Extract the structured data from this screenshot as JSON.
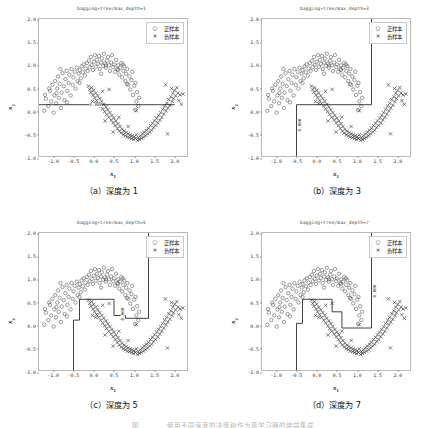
{
  "figure": {
    "caption_partial": "图　　　　使用不同深度的决策树作为基学习器的装袋集成",
    "legend": {
      "positive_label": "正样本",
      "negative_label": "负样本",
      "positive_marker": "circle-marker",
      "negative_marker": "cross-marker"
    },
    "axis": {
      "xlabel": "x1",
      "ylabel": "x2",
      "xticks": [
        "-1.0",
        "-0.5",
        "0.0",
        "0.5",
        "1.0",
        "1.5",
        "2.0"
      ],
      "yticks": [
        "2.0",
        "1.5",
        "1.0",
        "0.5",
        "0.0",
        "-0.5",
        "-1.0"
      ],
      "xlim": [
        -1.35,
        2.35
      ],
      "ylim": [
        -1.0,
        2.0
      ]
    },
    "colors": {
      "positive": "#4d4d4d",
      "negative": "#2b2b2b",
      "boundary": "#111111",
      "frame": "#b9b9b9"
    },
    "panels": [
      {
        "id": "panel-a",
        "title": "bagging+tree/max_depth=1",
        "caption": "（a）深度为 1",
        "max_depth": 1,
        "contour_label": "0.000"
      },
      {
        "id": "panel-b",
        "title": "bagging+tree/max_depth=3",
        "caption": "（b）深度为 3",
        "max_depth": 3,
        "contour_label": "0.000"
      },
      {
        "id": "panel-c",
        "title": "bagging+tree/max_depth=5",
        "caption": "（c）深度为 5",
        "max_depth": 5,
        "contour_label": "0.000"
      },
      {
        "id": "panel-d",
        "title": "bagging+tree/max_depth=7",
        "caption": "（d）深度为 7",
        "max_depth": 7,
        "contour_label": "0.000"
      }
    ]
  },
  "chart_data": {
    "type": "scatter",
    "xlabel": "x1",
    "ylabel": "x2",
    "xlim": [
      -1.35,
      2.35
    ],
    "ylim": [
      -1.0,
      2.0
    ],
    "grid": false,
    "legend_position": "upper right",
    "series": [
      {
        "name": "正样本",
        "marker": "o",
        "color": "#4d4d4d",
        "points": [
          [
            -1.22,
            0.02
          ],
          [
            -1.18,
            0.28
          ],
          [
            -1.12,
            0.12
          ],
          [
            -1.08,
            0.45
          ],
          [
            -1.05,
            0.22
          ],
          [
            -1.02,
            0.58
          ],
          [
            -0.99,
            -0.02
          ],
          [
            -0.97,
            0.35
          ],
          [
            -0.95,
            0.66
          ],
          [
            -0.93,
            0.18
          ],
          [
            -0.9,
            0.5
          ],
          [
            -0.88,
            0.76
          ],
          [
            -0.86,
            0.3
          ],
          [
            -0.84,
            0.6
          ],
          [
            -0.81,
            0.08
          ],
          [
            -0.79,
            0.41
          ],
          [
            -0.77,
            0.83
          ],
          [
            -0.74,
            0.55
          ],
          [
            -0.72,
            0.25
          ],
          [
            -0.7,
            0.7
          ],
          [
            -0.67,
            0.88
          ],
          [
            -0.65,
            0.45
          ],
          [
            -0.62,
            0.62
          ],
          [
            -0.6,
            0.8
          ],
          [
            -0.57,
            0.35
          ],
          [
            -0.55,
            0.92
          ],
          [
            -0.52,
            0.58
          ],
          [
            -0.5,
            0.74
          ],
          [
            -0.47,
            0.86
          ],
          [
            -0.45,
            0.5
          ],
          [
            -0.42,
            0.95
          ],
          [
            -0.4,
            0.66
          ],
          [
            -0.37,
            0.82
          ],
          [
            -0.35,
            0.9
          ],
          [
            -0.32,
            0.72
          ],
          [
            -0.3,
            0.98
          ],
          [
            -0.27,
            0.85
          ],
          [
            -0.25,
            1.02
          ],
          [
            -0.22,
            0.78
          ],
          [
            -0.2,
            0.93
          ],
          [
            -0.17,
            1.05
          ],
          [
            -0.15,
            0.88
          ],
          [
            -0.12,
            1.1
          ],
          [
            -0.1,
            0.96
          ],
          [
            -0.07,
            1.18
          ],
          [
            -0.05,
            1.01
          ],
          [
            -0.02,
            0.9
          ],
          [
            0.0,
            1.08
          ],
          [
            0.03,
            1.22
          ],
          [
            0.05,
            0.97
          ],
          [
            0.08,
            1.12
          ],
          [
            0.1,
            1.03
          ],
          [
            0.13,
            1.2
          ],
          [
            0.15,
            0.92
          ],
          [
            0.18,
            1.06
          ],
          [
            0.2,
            1.15
          ],
          [
            0.23,
            0.99
          ],
          [
            0.25,
            1.25
          ],
          [
            0.28,
            1.04
          ],
          [
            0.3,
            0.95
          ],
          [
            0.33,
            1.1
          ],
          [
            0.35,
            1.18
          ],
          [
            0.38,
            1.0
          ],
          [
            0.4,
            0.88
          ],
          [
            0.43,
            1.06
          ],
          [
            0.45,
            1.22
          ],
          [
            0.48,
            0.96
          ],
          [
            0.5,
            1.02
          ],
          [
            0.53,
            0.86
          ],
          [
            0.55,
            1.12
          ],
          [
            0.58,
            0.92
          ],
          [
            0.6,
            1.0
          ],
          [
            0.63,
            0.8
          ],
          [
            0.65,
            0.95
          ],
          [
            0.68,
            1.05
          ],
          [
            0.7,
            0.74
          ],
          [
            0.73,
            0.88
          ],
          [
            0.75,
            0.98
          ],
          [
            0.78,
            0.66
          ],
          [
            0.8,
            0.82
          ],
          [
            0.83,
            0.92
          ],
          [
            0.85,
            0.58
          ],
          [
            0.88,
            0.76
          ],
          [
            0.9,
            0.48
          ],
          [
            0.93,
            0.68
          ],
          [
            0.95,
            0.86
          ],
          [
            0.97,
            0.36
          ],
          [
            1.0,
            0.56
          ],
          [
            1.02,
            0.04
          ],
          [
            1.05,
            0.22
          ],
          [
            1.07,
            0.42
          ],
          [
            1.1,
            0.12
          ],
          [
            1.12,
            0.3
          ],
          [
            0.82,
            0.6
          ],
          [
            0.6,
            0.9
          ],
          [
            -0.92,
            0.4
          ],
          [
            -1.1,
            0.5
          ],
          [
            -0.66,
            0.2
          ],
          [
            -0.35,
            0.62
          ],
          [
            0.18,
            0.82
          ],
          [
            -1.2,
            0.36
          ],
          [
            -0.82,
            0.92
          ],
          [
            0.3,
            1.0
          ],
          [
            0.72,
            1.02
          ],
          [
            1.03,
            0.62
          ]
        ]
      },
      {
        "name": "负样本",
        "marker": "x",
        "color": "#2b2b2b",
        "points": [
          [
            -0.13,
            0.55
          ],
          [
            -0.1,
            0.48
          ],
          [
            -0.07,
            0.42
          ],
          [
            -0.05,
            0.52
          ],
          [
            -0.02,
            0.36
          ],
          [
            0.0,
            0.46
          ],
          [
            0.02,
            0.3
          ],
          [
            0.05,
            0.4
          ],
          [
            0.07,
            0.24
          ],
          [
            0.1,
            0.34
          ],
          [
            0.12,
            0.18
          ],
          [
            0.15,
            0.28
          ],
          [
            0.17,
            0.12
          ],
          [
            0.2,
            0.22
          ],
          [
            0.22,
            0.06
          ],
          [
            0.25,
            0.16
          ],
          [
            0.27,
            0.0
          ],
          [
            0.3,
            0.1
          ],
          [
            0.32,
            -0.06
          ],
          [
            0.35,
            0.04
          ],
          [
            0.37,
            -0.12
          ],
          [
            0.4,
            -0.02
          ],
          [
            0.43,
            -0.18
          ],
          [
            0.45,
            -0.08
          ],
          [
            0.48,
            -0.24
          ],
          [
            0.5,
            -0.14
          ],
          [
            0.53,
            -0.3
          ],
          [
            0.55,
            -0.2
          ],
          [
            0.58,
            -0.36
          ],
          [
            0.6,
            -0.26
          ],
          [
            0.63,
            -0.42
          ],
          [
            0.65,
            -0.32
          ],
          [
            0.68,
            -0.46
          ],
          [
            0.7,
            -0.38
          ],
          [
            0.73,
            -0.5
          ],
          [
            0.75,
            -0.42
          ],
          [
            0.78,
            -0.52
          ],
          [
            0.8,
            -0.45
          ],
          [
            0.83,
            -0.55
          ],
          [
            0.85,
            -0.48
          ],
          [
            0.88,
            -0.56
          ],
          [
            0.9,
            -0.5
          ],
          [
            0.93,
            -0.58
          ],
          [
            0.95,
            -0.52
          ],
          [
            0.98,
            -0.6
          ],
          [
            1.0,
            -0.54
          ],
          [
            1.03,
            -0.58
          ],
          [
            1.05,
            -0.5
          ],
          [
            1.08,
            -0.62
          ],
          [
            1.1,
            -0.56
          ],
          [
            1.13,
            -0.6
          ],
          [
            1.15,
            -0.52
          ],
          [
            1.18,
            -0.58
          ],
          [
            1.2,
            -0.48
          ],
          [
            1.23,
            -0.55
          ],
          [
            1.25,
            -0.44
          ],
          [
            1.28,
            -0.52
          ],
          [
            1.3,
            -0.4
          ],
          [
            1.33,
            -0.48
          ],
          [
            1.35,
            -0.36
          ],
          [
            1.38,
            -0.44
          ],
          [
            1.4,
            -0.3
          ],
          [
            1.43,
            -0.4
          ],
          [
            1.45,
            -0.25
          ],
          [
            1.48,
            -0.34
          ],
          [
            1.5,
            -0.2
          ],
          [
            1.53,
            -0.3
          ],
          [
            1.55,
            -0.14
          ],
          [
            1.58,
            -0.24
          ],
          [
            1.6,
            -0.08
          ],
          [
            1.63,
            -0.18
          ],
          [
            1.65,
            -0.02
          ],
          [
            1.68,
            -0.12
          ],
          [
            1.7,
            0.05
          ],
          [
            1.73,
            -0.05
          ],
          [
            1.75,
            0.12
          ],
          [
            1.78,
            0.02
          ],
          [
            1.8,
            0.18
          ],
          [
            1.83,
            0.08
          ],
          [
            1.85,
            0.26
          ],
          [
            1.88,
            0.14
          ],
          [
            1.9,
            0.32
          ],
          [
            1.93,
            0.22
          ],
          [
            1.95,
            0.4
          ],
          [
            1.97,
            0.28
          ],
          [
            2.0,
            0.46
          ],
          [
            2.02,
            0.34
          ],
          [
            2.05,
            0.52
          ],
          [
            2.08,
            0.4
          ],
          [
            2.1,
            0.24
          ],
          [
            2.13,
            0.36
          ],
          [
            2.16,
            0.16
          ],
          [
            2.2,
            0.38
          ],
          [
            1.77,
            0.58
          ],
          [
            1.82,
            -0.48
          ],
          [
            0.38,
            0.48
          ],
          [
            0.22,
            0.44
          ],
          [
            0.05,
            0.18
          ],
          [
            -0.03,
            0.22
          ],
          [
            0.48,
            -0.44
          ],
          [
            0.28,
            -0.2
          ],
          [
            0.62,
            -0.12
          ],
          [
            0.85,
            -0.32
          ],
          [
            1.05,
            0.02
          ],
          [
            1.92,
            0.5
          ]
        ]
      }
    ],
    "panels": [
      {
        "label": "(a) 深度为 1",
        "max_depth": 1,
        "boundary_level": "0.000",
        "boundary_path": [
          [
            -1.35,
            0.15
          ],
          [
            2.0,
            0.15
          ]
        ]
      },
      {
        "label": "(b) 深度为 3",
        "max_depth": 3,
        "boundary_level": "0.000",
        "boundary_path": [
          [
            -0.5,
            -1.0
          ],
          [
            -0.5,
            0.15
          ],
          [
            1.35,
            0.15
          ],
          [
            1.35,
            2.0
          ]
        ]
      },
      {
        "label": "(c) 深度为 5",
        "max_depth": 5,
        "boundary_level": "0.000",
        "boundary_path": [
          [
            -0.5,
            -1.0
          ],
          [
            -0.5,
            0.12
          ],
          [
            -0.35,
            0.12
          ],
          [
            -0.35,
            0.57
          ],
          [
            0.5,
            0.57
          ],
          [
            0.5,
            0.22
          ],
          [
            0.78,
            0.22
          ],
          [
            0.78,
            0.16
          ],
          [
            1.35,
            0.16
          ],
          [
            1.35,
            2.0
          ]
        ]
      },
      {
        "label": "(d) 深度为 7",
        "max_depth": 7,
        "boundary_level": "0.000",
        "boundary_path": [
          [
            -0.5,
            -1.0
          ],
          [
            -0.5,
            0.05
          ],
          [
            -0.35,
            0.05
          ],
          [
            -0.35,
            0.57
          ],
          [
            0.38,
            0.57
          ],
          [
            0.38,
            0.3
          ],
          [
            0.62,
            0.3
          ],
          [
            0.62,
            -0.05
          ],
          [
            1.35,
            -0.05
          ],
          [
            1.35,
            2.0
          ]
        ]
      }
    ]
  }
}
